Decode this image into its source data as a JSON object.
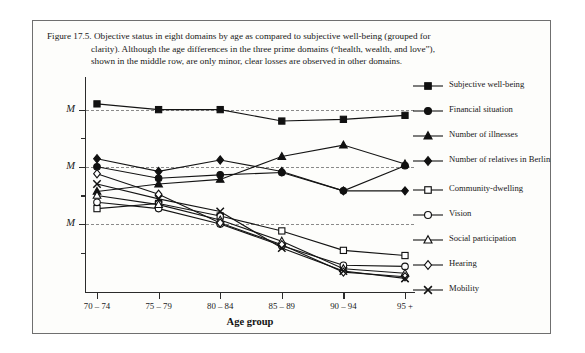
{
  "figure": {
    "number": "Figure 17.5.",
    "caption_line1": "Objective status in eight domains by age as compared to subjective well-being (grouped for",
    "caption_line2": "clarity). Although the age differences in the three prime domains (“health, wealth, and love”),",
    "caption_line3": "shown in the middle row, are only minor, clear losses are observed in other domains."
  },
  "axes": {
    "ylabels": [
      "M",
      "M",
      "M"
    ],
    "xaxis_title": "Age group"
  },
  "legend": {
    "items": [
      {
        "label": "Subjective well-being",
        "marker": "filled-square-marker"
      },
      {
        "label": "Financial situation",
        "marker": "filled-circle-marker"
      },
      {
        "label": "Number of illnesses",
        "marker": "filled-triangle-marker"
      },
      {
        "label": "Number of relatives in Berlin",
        "marker": "filled-diamond-marker"
      },
      {
        "label": "Community-dwelling",
        "marker": "open-square-marker"
      },
      {
        "label": "Vision",
        "marker": "open-circle-marker"
      },
      {
        "label": "Social participation",
        "marker": "open-triangle-marker"
      },
      {
        "label": "Hearing",
        "marker": "open-diamond-marker"
      },
      {
        "label": "Mobility",
        "marker": "cross-x-marker"
      }
    ]
  },
  "chart_data": {
    "type": "line",
    "title": "Objective status in eight domains by age as compared to subjective well-being",
    "xlabel": "Age group",
    "ylabel": "M",
    "categories": [
      "70 – 74",
      "75 – 79",
      "80 – 84",
      "85 – 89",
      "90 – 94",
      "95 +"
    ],
    "grid": true,
    "gridline_values": [
      1.0,
      0.0,
      -1.0
    ],
    "ytick_labels": [
      "M",
      "M",
      "M"
    ],
    "ylim": [
      -2.1,
      1.5
    ],
    "legend_position": "right",
    "series": [
      {
        "name": "Subjective well-being",
        "marker": "filled-square",
        "values": [
          1.1,
          1.0,
          1.0,
          0.8,
          0.83,
          0.9
        ]
      },
      {
        "name": "Financial situation",
        "marker": "filled-circle",
        "values": [
          0.0,
          -0.2,
          -0.14,
          -0.1,
          -0.42,
          0.02
        ]
      },
      {
        "name": "Number of illnesses",
        "marker": "filled-triangle",
        "values": [
          -0.43,
          -0.3,
          -0.22,
          0.18,
          0.38,
          0.05
        ]
      },
      {
        "name": "Number of relatives in Berlin",
        "marker": "filled-diamond",
        "values": [
          0.14,
          -0.08,
          0.12,
          -0.08,
          -0.42,
          -0.42
        ]
      },
      {
        "name": "Community-dwelling",
        "marker": "open-square",
        "values": [
          -0.73,
          -0.64,
          -0.86,
          -1.12,
          -1.46,
          -1.55
        ]
      },
      {
        "name": "Vision",
        "marker": "open-circle",
        "values": [
          -0.62,
          -0.73,
          -1.0,
          -1.38,
          -1.72,
          -1.74
        ]
      },
      {
        "name": "Social participation",
        "marker": "open-triangle",
        "values": [
          -0.5,
          -0.66,
          -0.93,
          -1.3,
          -1.78,
          -1.86
        ]
      },
      {
        "name": "Hearing",
        "marker": "open-diamond",
        "values": [
          -0.12,
          -0.48,
          -0.98,
          -1.36,
          -1.84,
          -1.92
        ]
      },
      {
        "name": "Mobility",
        "marker": "cross-x",
        "values": [
          -0.3,
          -0.56,
          -0.78,
          -1.42,
          -1.82,
          -1.95
        ]
      }
    ]
  }
}
